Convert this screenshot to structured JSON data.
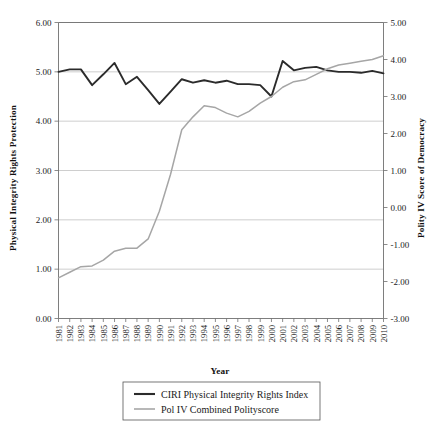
{
  "chart_data": {
    "type": "line",
    "title": "",
    "xlabel": "Year",
    "ylabel": "Physical Integrity Rights Protection",
    "y2label": "Polity IV Score of Democracy",
    "grid": true,
    "legend_position": "bottom",
    "x": [
      1981,
      1982,
      1983,
      1984,
      1985,
      1986,
      1987,
      1988,
      1989,
      1990,
      1991,
      1992,
      1993,
      1994,
      1995,
      1996,
      1997,
      1998,
      1999,
      2000,
      2001,
      2002,
      2003,
      2004,
      2005,
      2006,
      2007,
      2008,
      2009,
      2010
    ],
    "categories": [
      "1981",
      "1982",
      "1983",
      "1984",
      "1985",
      "1986",
      "1987",
      "1988",
      "1989",
      "1990",
      "1991",
      "1992",
      "1993",
      "1994",
      "1995",
      "1996",
      "1997",
      "1998",
      "1999",
      "2000",
      "2001",
      "2002",
      "2003",
      "2004",
      "2005",
      "2006",
      "2007",
      "2008",
      "2009",
      "2010"
    ],
    "ylim": [
      0.0,
      6.0
    ],
    "yticks": [
      "0.00",
      "1.00",
      "2.00",
      "3.00",
      "4.00",
      "5.00",
      "6.00"
    ],
    "ytick_values": [
      0.0,
      1.0,
      2.0,
      3.0,
      4.0,
      5.0,
      6.0
    ],
    "y2lim": [
      -3.0,
      5.0
    ],
    "y2ticks": [
      "-3.00",
      "-2.00",
      "-1.00",
      "0.00",
      "1.00",
      "2.00",
      "3.00",
      "4.00",
      "5.00"
    ],
    "y2tick_values": [
      -3.0,
      -2.0,
      -1.0,
      0.0,
      1.0,
      2.0,
      3.0,
      4.0,
      5.0
    ],
    "series": [
      {
        "name": "CIRI Physical Integrity Rights Index",
        "axis": "left",
        "color": "#2b2b2b",
        "values": [
          5.0,
          5.05,
          5.05,
          4.73,
          4.95,
          5.18,
          4.75,
          4.9,
          4.63,
          4.35,
          4.6,
          4.85,
          4.78,
          4.83,
          4.78,
          4.82,
          4.75,
          4.75,
          4.73,
          4.5,
          5.22,
          5.03,
          5.08,
          5.1,
          5.03,
          5.0,
          5.0,
          4.98,
          5.02,
          4.97
        ]
      },
      {
        "name": "Pol IV Combined Polityscore",
        "axis": "right",
        "color": "#a6a6a6",
        "values": [
          -1.9,
          -1.75,
          -1.6,
          -1.58,
          -1.42,
          -1.18,
          -1.1,
          -1.1,
          -0.85,
          -0.1,
          0.9,
          2.1,
          2.45,
          2.75,
          2.7,
          2.55,
          2.45,
          2.6,
          2.82,
          3.0,
          3.25,
          3.4,
          3.45,
          3.6,
          3.75,
          3.85,
          3.9,
          3.95,
          4.0,
          4.1
        ]
      }
    ]
  },
  "legend": {
    "items": [
      {
        "label": "CIRI Physical Integrity Rights Index",
        "color": "#2b2b2b"
      },
      {
        "label": "Pol IV Combined Polityscore",
        "color": "#a6a6a6"
      }
    ]
  }
}
